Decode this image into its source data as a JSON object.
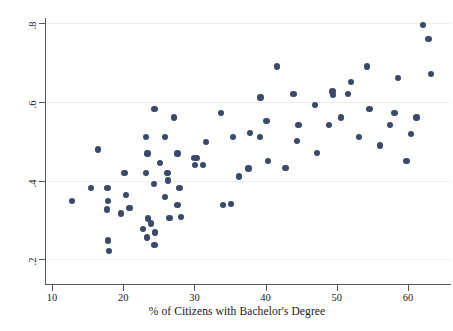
{
  "chart_data": {
    "type": "scatter",
    "title": "",
    "xlabel": "% of Citizens with Bachelor's Degree",
    "ylabel": "Share Voted Yes for Prop. 122",
    "xlim": [
      8.0,
      66.0
    ],
    "ylim": [
      0.185,
      0.815
    ],
    "xticks": [
      10,
      20,
      30,
      40,
      50,
      60
    ],
    "xtick_labels": [
      "10",
      "20",
      "30",
      "40",
      "50",
      "60"
    ],
    "yticks": [
      0.2,
      0.4,
      0.6,
      0.8
    ],
    "ytick_labels": [
      ".2",
      ".4",
      ".6",
      ".8"
    ],
    "grid": false,
    "legend": null,
    "marker_color": "#3b4a6b",
    "marker_size": 6.4,
    "n_points": 76,
    "points": [
      {
        "x": 12.8,
        "y": 0.348
      },
      {
        "x": 15.5,
        "y": 0.381
      },
      {
        "x": 16.5,
        "y": 0.479
      },
      {
        "x": 17.8,
        "y": 0.381
      },
      {
        "x": 17.9,
        "y": 0.349
      },
      {
        "x": 17.7,
        "y": 0.327
      },
      {
        "x": 17.9,
        "y": 0.248
      },
      {
        "x": 18.0,
        "y": 0.221
      },
      {
        "x": 19.7,
        "y": 0.317
      },
      {
        "x": 20.2,
        "y": 0.419
      },
      {
        "x": 20.4,
        "y": 0.363
      },
      {
        "x": 22.8,
        "y": 0.277
      },
      {
        "x": 23.2,
        "y": 0.511
      },
      {
        "x": 23.4,
        "y": 0.469
      },
      {
        "x": 23.2,
        "y": 0.419
      },
      {
        "x": 23.5,
        "y": 0.304
      },
      {
        "x": 23.3,
        "y": 0.256
      },
      {
        "x": 24.4,
        "y": 0.581
      },
      {
        "x": 24.3,
        "y": 0.391
      },
      {
        "x": 24.5,
        "y": 0.268
      },
      {
        "x": 24.4,
        "y": 0.237
      },
      {
        "x": 25.9,
        "y": 0.511
      },
      {
        "x": 26.2,
        "y": 0.42
      },
      {
        "x": 26.3,
        "y": 0.4
      },
      {
        "x": 26.5,
        "y": 0.305
      },
      {
        "x": 27.1,
        "y": 0.56
      },
      {
        "x": 27.6,
        "y": 0.469
      },
      {
        "x": 27.9,
        "y": 0.381
      },
      {
        "x": 27.6,
        "y": 0.338
      },
      {
        "x": 29.9,
        "y": 0.458
      },
      {
        "x": 30.3,
        "y": 0.458
      },
      {
        "x": 30.1,
        "y": 0.439
      },
      {
        "x": 31.2,
        "y": 0.439
      },
      {
        "x": 33.7,
        "y": 0.571
      },
      {
        "x": 34.0,
        "y": 0.338
      },
      {
        "x": 35.4,
        "y": 0.511
      },
      {
        "x": 36.3,
        "y": 0.41
      },
      {
        "x": 37.8,
        "y": 0.521
      },
      {
        "x": 37.6,
        "y": 0.431
      },
      {
        "x": 39.3,
        "y": 0.611
      },
      {
        "x": 39.2,
        "y": 0.511
      },
      {
        "x": 40.1,
        "y": 0.551
      },
      {
        "x": 40.3,
        "y": 0.449
      },
      {
        "x": 41.6,
        "y": 0.69
      },
      {
        "x": 43.9,
        "y": 0.62
      },
      {
        "x": 44.6,
        "y": 0.541
      },
      {
        "x": 44.4,
        "y": 0.5
      },
      {
        "x": 46.9,
        "y": 0.592
      },
      {
        "x": 48.9,
        "y": 0.541
      },
      {
        "x": 49.4,
        "y": 0.626
      },
      {
        "x": 49.5,
        "y": 0.618
      },
      {
        "x": 50.6,
        "y": 0.56
      },
      {
        "x": 51.6,
        "y": 0.62
      },
      {
        "x": 52.0,
        "y": 0.65
      },
      {
        "x": 54.2,
        "y": 0.69
      },
      {
        "x": 54.6,
        "y": 0.581
      },
      {
        "x": 57.5,
        "y": 0.541
      },
      {
        "x": 58.1,
        "y": 0.571
      },
      {
        "x": 58.6,
        "y": 0.661
      },
      {
        "x": 59.8,
        "y": 0.449
      },
      {
        "x": 62.1,
        "y": 0.795
      },
      {
        "x": 62.9,
        "y": 0.759
      },
      {
        "x": 63.2,
        "y": 0.671
      },
      {
        "x": 25.2,
        "y": 0.444
      },
      {
        "x": 23.9,
        "y": 0.291
      },
      {
        "x": 20.9,
        "y": 0.331
      },
      {
        "x": 25.9,
        "y": 0.358
      },
      {
        "x": 28.1,
        "y": 0.307
      },
      {
        "x": 31.6,
        "y": 0.498
      },
      {
        "x": 35.1,
        "y": 0.341
      },
      {
        "x": 42.8,
        "y": 0.432
      },
      {
        "x": 47.2,
        "y": 0.47
      },
      {
        "x": 53.1,
        "y": 0.51
      },
      {
        "x": 56.1,
        "y": 0.489
      },
      {
        "x": 60.4,
        "y": 0.518
      },
      {
        "x": 61.2,
        "y": 0.56
      }
    ]
  },
  "axes": {
    "y_title": "Share Voted Yes for Prop. 122",
    "x_title": "% of Citizens with Bachelor's Degree"
  }
}
